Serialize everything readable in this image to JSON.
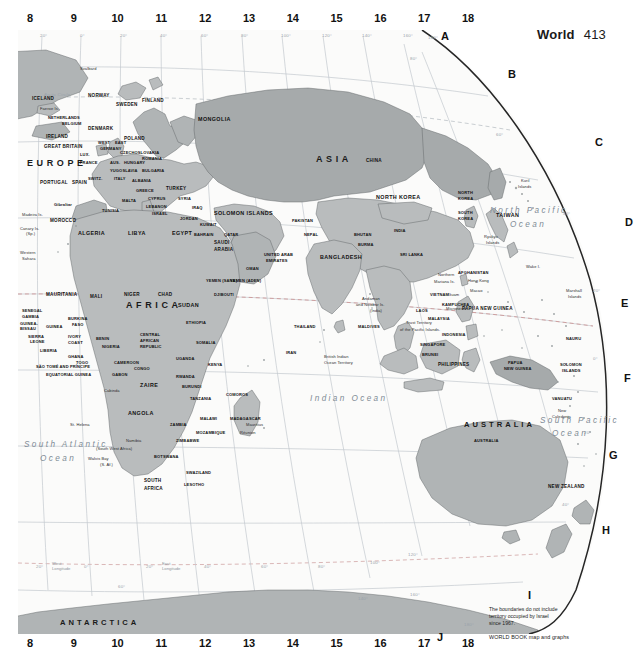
{
  "header": {
    "title": "World",
    "page_number": "413"
  },
  "grid_index": {
    "columns": [
      "8",
      "9",
      "10",
      "11",
      "12",
      "13",
      "14",
      "15",
      "16",
      "17",
      "18"
    ],
    "rows": [
      "A",
      "B",
      "C",
      "D",
      "E",
      "F",
      "G",
      "H",
      "I",
      "J"
    ]
  },
  "graticule": {
    "longitude_labels": [
      "20°",
      "0°",
      "20°",
      "40°",
      "60°",
      "80°",
      "100°",
      "120°",
      "140°",
      "160°",
      "180°"
    ],
    "latitude_labels": [
      "80°",
      "60°",
      "40°",
      "20°",
      "0°",
      "20°",
      "40°",
      "60°"
    ],
    "west_longitude_note": "West\nLongitude",
    "east_longitude_note": "East\nLongitude",
    "arctic_circle": "Arctic Circle"
  },
  "oceans": [
    {
      "name": "North Pacific Ocean",
      "line1": "North Pacific",
      "line2": "Ocean"
    },
    {
      "name": "South Pacific Ocean",
      "line1": "South Pacific",
      "line2": "Ocean"
    },
    {
      "name": "South Atlantic Ocean",
      "line1": "South Atlantic",
      "line2": "Ocean"
    },
    {
      "name": "Indian Ocean",
      "line1": "Indian Ocean",
      "line2": ""
    }
  ],
  "continents": [
    {
      "label": "EUROPE"
    },
    {
      "label": "ASIA"
    },
    {
      "label": "AFRICA"
    },
    {
      "label": "AUSTRALIA"
    },
    {
      "label": "ANTARCTICA"
    }
  ],
  "countries": [
    "ICELAND",
    "NORWAY",
    "SWEDEN",
    "FINLAND",
    "NETHERLANDS",
    "BELGIUM",
    "DENMARK",
    "IRELAND",
    "GREAT BRITAIN",
    "POLAND",
    "WEST",
    "EAST",
    "GERMANY",
    "CZECHOSLOVAKIA",
    "LUX.",
    "FRANCE",
    "AUS.",
    "HUNGARY",
    "ROMANIA",
    "YUGOSLAVIA",
    "BULGARIA",
    "SWITZ.",
    "ITALY",
    "ALBANIA",
    "GREECE",
    "PORTUGAL",
    "SPAIN",
    "MALTA",
    "TURKEY",
    "CYPRUS",
    "SYRIA",
    "LEBANON",
    "ISRAEL",
    "IRAQ",
    "JORDAN",
    "MOROCCO",
    "TUNISIA",
    "ALGERIA",
    "LIBYA",
    "EGYPT",
    "SAUDI ARABIA",
    "BAHRAIN",
    "QATAR",
    "KUWAIT",
    "UNITED ARAB EMIRATES",
    "OMAN",
    "YEMEN (SANA)",
    "YEMEN (ADEN)",
    "DJIBOUTI",
    "ETHIOPIA",
    "SOMALIA",
    "SUDAN",
    "CHAD",
    "NIGER",
    "MALI",
    "MAURITANIA",
    "SENEGAL",
    "GAMBIA",
    "GUINEA-BISSAU",
    "GUINEA",
    "SIERRA LEONE",
    "LIBERIA",
    "IVORY COAST",
    "BURKINA FASO",
    "GHANA",
    "TOGO",
    "BENIN",
    "NIGERIA",
    "CAMEROON",
    "CENTRAL AFRICAN REPUBLIC",
    "EQUATORIAL GUINEA",
    "SÃO TOMÉ AND PRÍNCIPE",
    "GABON",
    "CONGO",
    "ZAIRE",
    "UGANDA",
    "KENYA",
    "RWANDA",
    "BURUNDI",
    "TANZANIA",
    "ANGOLA",
    "ZAMBIA",
    "MALAWI",
    "MOZAMBIQUE",
    "ZIMBABWE",
    "BOTSWANA",
    "SWAZILAND",
    "LESOTHO",
    "SOUTH AFRICA",
    "MADAGASCAR",
    "COMOROS",
    "UNION OF SOVIET SOCIALIST REPUBLICS",
    "MONGOLIA",
    "CHINA",
    "NORTH KOREA",
    "SOUTH KOREA",
    "JAPAN",
    "TAIWAN",
    "AFGHANISTAN",
    "PAKISTAN",
    "NEPAL",
    "BHUTAN",
    "INDIA",
    "BANGLADESH",
    "BURMA",
    "SRI LANKA",
    "MALDIVES",
    "THAILAND",
    "LAOS",
    "VIETNAM",
    "KAMPUCHEA",
    "MALAYSIA",
    "SINGAPORE",
    "BRUNEI",
    "INDONESIA",
    "PHILIPPINES",
    "PAPUA NEW GUINEA",
    "SOLOMON ISLANDS",
    "VANUATU",
    "NAURU",
    "NEW ZEALAND",
    "IRAN",
    "SEYCHELLES"
  ],
  "places": [
    "Svalbard",
    "Faeroe Is.",
    "Gibraltar",
    "Madeira Is.",
    "Canary Is. (Sp.)",
    "Western Sahara",
    "Cabinda",
    "St. Helena",
    "Namibia (South West Africa)",
    "Walvis Bay (S. Af.)",
    "Mauritius",
    "Réunion",
    "Kuril Islands",
    "Ryukyu Islands",
    "Hong Kong",
    "Macao",
    "Andaman and Nicobar Is. (India)",
    "British Indian Ocean Territory",
    "Northern Mariana Is.",
    "Guam",
    "Micronesia",
    "Trust Territory of the Pacific Islands",
    "Wake I.",
    "Marshall Islands",
    "New Caledonia"
  ],
  "footnote": {
    "disclaimer_line1": "The boundaries do not include",
    "disclaimer_line2": "territory occupied by Israel",
    "disclaimer_line3": "since 1967.",
    "credit": "WORLD BOOK map and graphs"
  },
  "colors": {
    "land": "#b9bcbd",
    "land_dark": "#a6aaab",
    "ocean": "#fbfbfa",
    "frame": "#2a2a2a",
    "graticule": "#b9bfc4",
    "ocean_text": "#7f8b96"
  }
}
